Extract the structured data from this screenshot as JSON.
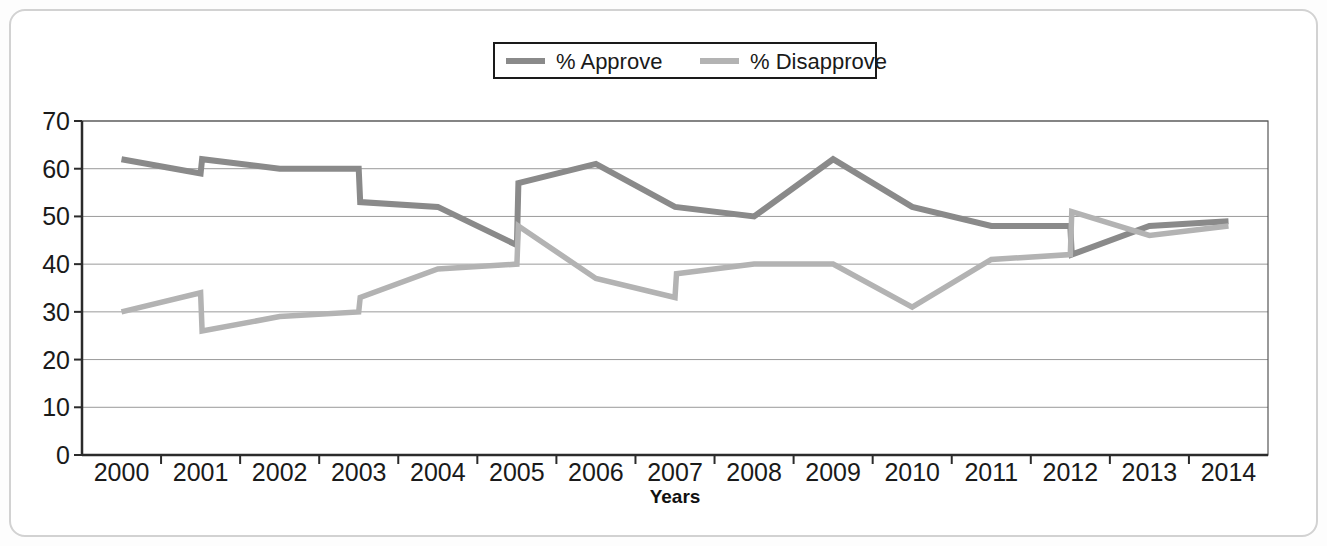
{
  "figure": {
    "frame_color": "#d2d2d2",
    "background": "#ffffff"
  },
  "legend": {
    "position": "top-center",
    "boxed": true,
    "items": [
      {
        "label": "% Approve",
        "color": "#8a8a8a"
      },
      {
        "label": "% Disapprove",
        "color": "#b3b3b3"
      }
    ]
  },
  "axes": {
    "y_ticks": [
      "70",
      "60",
      "50",
      "40",
      "30",
      "20",
      "10",
      "0"
    ],
    "x_ticks": [
      "2000",
      "2001",
      "2002",
      "2003",
      "2004",
      "2005",
      "2006",
      "2007",
      "2008",
      "2009",
      "2010",
      "2011",
      "2012",
      "2013",
      "2014"
    ],
    "x_title": "Years",
    "y_title": ""
  },
  "chart_data": {
    "type": "line",
    "title": "",
    "xlabel": "Years",
    "ylabel": "",
    "ylim": [
      0,
      70
    ],
    "ytick_step": 10,
    "grid": true,
    "legend_position": "top-center",
    "categories": [
      "2000",
      "2001",
      "2002",
      "2003",
      "2004",
      "2005",
      "2006",
      "2007",
      "2008",
      "2009",
      "2010",
      "2011",
      "2012",
      "2013",
      "2014"
    ],
    "note": "Each year carries two readings (start / end of year), producing vertical step transitions.",
    "series": [
      {
        "name": "% Approve",
        "color": "#8a8a8a",
        "points": [
          {
            "x": "2000",
            "phase": "a",
            "value": 62
          },
          {
            "x": "2001",
            "phase": "a",
            "value": 59
          },
          {
            "x": "2001",
            "phase": "b",
            "value": 62
          },
          {
            "x": "2002",
            "phase": "a",
            "value": 60
          },
          {
            "x": "2003",
            "phase": "a",
            "value": 60
          },
          {
            "x": "2003",
            "phase": "b",
            "value": 53
          },
          {
            "x": "2004",
            "phase": "a",
            "value": 52
          },
          {
            "x": "2005",
            "phase": "a",
            "value": 44
          },
          {
            "x": "2005",
            "phase": "b",
            "value": 57
          },
          {
            "x": "2006",
            "phase": "a",
            "value": 61
          },
          {
            "x": "2007",
            "phase": "a",
            "value": 52
          },
          {
            "x": "2008",
            "phase": "a",
            "value": 50
          },
          {
            "x": "2009",
            "phase": "a",
            "value": 62
          },
          {
            "x": "2010",
            "phase": "a",
            "value": 52
          },
          {
            "x": "2011",
            "phase": "a",
            "value": 48
          },
          {
            "x": "2012",
            "phase": "a",
            "value": 48
          },
          {
            "x": "2012",
            "phase": "b",
            "value": 42
          },
          {
            "x": "2013",
            "phase": "a",
            "value": 48
          },
          {
            "x": "2014",
            "phase": "a",
            "value": 49
          }
        ]
      },
      {
        "name": "% Disapprove",
        "color": "#b3b3b3",
        "points": [
          {
            "x": "2000",
            "phase": "a",
            "value": 30
          },
          {
            "x": "2001",
            "phase": "a",
            "value": 34
          },
          {
            "x": "2001",
            "phase": "b",
            "value": 26
          },
          {
            "x": "2002",
            "phase": "a",
            "value": 29
          },
          {
            "x": "2003",
            "phase": "a",
            "value": 30
          },
          {
            "x": "2003",
            "phase": "b",
            "value": 33
          },
          {
            "x": "2004",
            "phase": "a",
            "value": 39
          },
          {
            "x": "2005",
            "phase": "a",
            "value": 40
          },
          {
            "x": "2005",
            "phase": "b",
            "value": 48
          },
          {
            "x": "2006",
            "phase": "a",
            "value": 37
          },
          {
            "x": "2007",
            "phase": "a",
            "value": 33
          },
          {
            "x": "2007",
            "phase": "b",
            "value": 38
          },
          {
            "x": "2008",
            "phase": "a",
            "value": 40
          },
          {
            "x": "2009",
            "phase": "a",
            "value": 40
          },
          {
            "x": "2010",
            "phase": "a",
            "value": 31
          },
          {
            "x": "2011",
            "phase": "a",
            "value": 41
          },
          {
            "x": "2012",
            "phase": "a",
            "value": 42
          },
          {
            "x": "2012",
            "phase": "b",
            "value": 51
          },
          {
            "x": "2013",
            "phase": "a",
            "value": 46
          },
          {
            "x": "2014",
            "phase": "a",
            "value": 48
          }
        ]
      }
    ]
  }
}
